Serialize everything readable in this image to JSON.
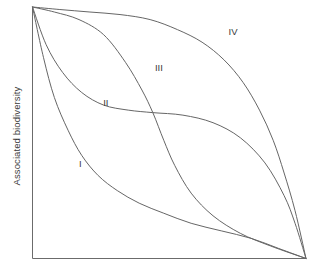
{
  "chart_data": {
    "type": "line",
    "title": "",
    "xlabel": "",
    "ylabel": "Associated biodiversity",
    "xlim": [
      0,
      1
    ],
    "ylim": [
      0,
      1
    ],
    "grid": false,
    "legend_position": "inline-annotations",
    "axes": {
      "left_axis_visible": true,
      "bottom_axis_visible": true,
      "top_axis_visible": false,
      "right_axis_visible": false,
      "ticks": "none",
      "xtick_labels": [],
      "ytick_labels": []
    },
    "annotations": [
      {
        "text": "I",
        "x": 0.175,
        "y": 0.375
      },
      {
        "text": "II",
        "x": 0.268,
        "y": 0.618
      },
      {
        "text": "III",
        "x": 0.462,
        "y": 0.757
      },
      {
        "text": "IV",
        "x": 0.733,
        "y": 0.897
      }
    ],
    "series": [
      {
        "name": "I",
        "shape": "steeply convex decreasing",
        "x": [
          0.0,
          0.04,
          0.08,
          0.13,
          0.18,
          0.24,
          0.31,
          0.39,
          0.48,
          0.58,
          0.69,
          0.8,
          0.9,
          1.0
        ],
        "y": [
          1.0,
          0.8,
          0.64,
          0.51,
          0.41,
          0.33,
          0.27,
          0.22,
          0.18,
          0.14,
          0.11,
          0.08,
          0.04,
          0.0
        ]
      },
      {
        "name": "II",
        "shape": "convex decreasing with mid plateau then late drop",
        "x": [
          0.0,
          0.05,
          0.11,
          0.18,
          0.26,
          0.35,
          0.44,
          0.55,
          0.66,
          0.76,
          0.85,
          0.92,
          0.96,
          1.0
        ],
        "y": [
          1.0,
          0.85,
          0.74,
          0.66,
          0.61,
          0.59,
          0.58,
          0.57,
          0.54,
          0.48,
          0.38,
          0.25,
          0.14,
          0.0
        ]
      },
      {
        "name": "III",
        "shape": "sigmoid decreasing with steep mid drop",
        "x": [
          0.0,
          0.08,
          0.17,
          0.26,
          0.34,
          0.4,
          0.44,
          0.48,
          0.52,
          0.58,
          0.66,
          0.76,
          0.87,
          1.0
        ],
        "y": [
          1.0,
          0.98,
          0.95,
          0.89,
          0.78,
          0.67,
          0.58,
          0.47,
          0.37,
          0.26,
          0.17,
          0.1,
          0.05,
          0.0
        ]
      },
      {
        "name": "IV",
        "shape": "concave decreasing, flat top with steep late drop",
        "x": [
          0.0,
          0.1,
          0.21,
          0.32,
          0.43,
          0.53,
          0.62,
          0.7,
          0.77,
          0.83,
          0.88,
          0.92,
          0.96,
          1.0
        ],
        "y": [
          1.0,
          0.99,
          0.98,
          0.97,
          0.95,
          0.91,
          0.86,
          0.79,
          0.7,
          0.59,
          0.47,
          0.34,
          0.19,
          0.0
        ]
      }
    ],
    "colors": {
      "curve_stroke": "#666666",
      "axis_stroke": "#6b6b6b",
      "text": "#3a3a3a",
      "background": "#ffffff"
    }
  }
}
